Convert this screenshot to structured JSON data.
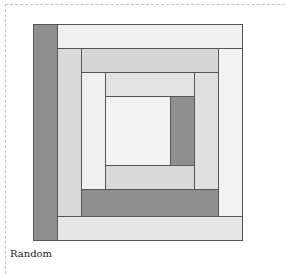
{
  "caption": "Random",
  "colors": {
    "dark": "#8f8f8f",
    "light": "#f0f0f0",
    "mid": "#d9d9d9",
    "border": "#555555"
  },
  "quilt_block": {
    "pattern": "log-cabin",
    "pieces": [
      {
        "name": "outer-left-dark",
        "x": 0,
        "y": 0,
        "w": 24,
        "h": 216,
        "color": "#8f8f8f"
      },
      {
        "name": "outer-top-light",
        "x": 24,
        "y": 0,
        "w": 185,
        "h": 24,
        "color": "#f0f0f0"
      },
      {
        "name": "outer-right-light",
        "x": 185,
        "y": 24,
        "w": 24,
        "h": 168,
        "color": "#f2f2f2"
      },
      {
        "name": "outer-bottom-light",
        "x": 24,
        "y": 192,
        "w": 185,
        "h": 24,
        "color": "#e6e6e6"
      },
      {
        "name": "ring2-left",
        "x": 24,
        "y": 24,
        "w": 24,
        "h": 168,
        "color": "#d9d9d9"
      },
      {
        "name": "ring2-top",
        "x": 48,
        "y": 24,
        "w": 137,
        "h": 24,
        "color": "#d6d6d6"
      },
      {
        "name": "ring2-right",
        "x": 161,
        "y": 48,
        "w": 24,
        "h": 117,
        "color": "#e0e0e0"
      },
      {
        "name": "ring2-bottom-dark",
        "x": 48,
        "y": 165,
        "w": 137,
        "h": 27,
        "color": "#8f8f8f"
      },
      {
        "name": "ring3-left",
        "x": 48,
        "y": 48,
        "w": 24,
        "h": 117,
        "color": "#f0f0f0"
      },
      {
        "name": "ring3-top",
        "x": 72,
        "y": 48,
        "w": 89,
        "h": 24,
        "color": "#e3e3e3"
      },
      {
        "name": "ring3-right-dark",
        "x": 137,
        "y": 72,
        "w": 24,
        "h": 69,
        "color": "#8f8f8f"
      },
      {
        "name": "ring3-bottom",
        "x": 72,
        "y": 141,
        "w": 89,
        "h": 24,
        "color": "#dadada"
      },
      {
        "name": "center",
        "x": 72,
        "y": 72,
        "w": 65,
        "h": 69,
        "color": "#f2f2f2"
      }
    ]
  }
}
